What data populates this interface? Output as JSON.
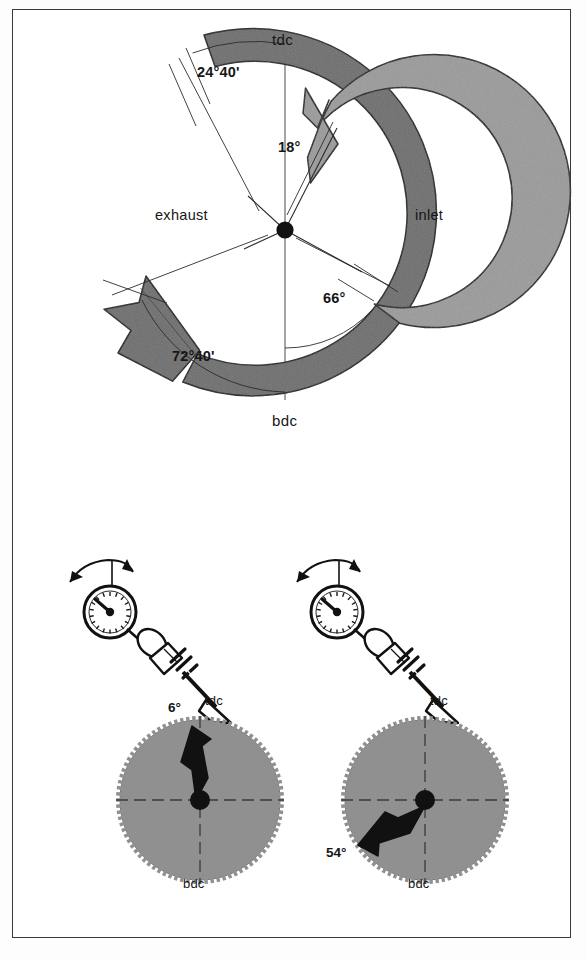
{
  "page": {
    "background_color": "#ffffff",
    "frame_color": "#3a3a3a"
  },
  "colors": {
    "inlet_ring": "#6e6e6e",
    "exhaust_ring": "#9a9a9a",
    "gear_fill": "#8c8c8c",
    "ink": "#161616",
    "outline": "#1a1a1a"
  },
  "timing_diagram": {
    "markers": {
      "top_dead_center": "tdc",
      "bottom_dead_center": "bdc"
    },
    "rings": [
      {
        "name": "inlet",
        "label": "inlet",
        "shade": "dark",
        "open_label": "24°40'",
        "close_label": "72°40'",
        "open_before_tdc_deg": 24.67,
        "close_after_bdc_deg": 72.67
      },
      {
        "name": "exhaust",
        "label": "exhaust",
        "shade": "light",
        "open_label": "66°",
        "close_label": "18°",
        "open_before_bdc_deg": 66,
        "close_after_tdc_deg": 18
      }
    ],
    "angle_labels": [
      {
        "id": "inlet-open",
        "text": "24°40'",
        "x": 197,
        "y": 72
      },
      {
        "id": "exhaust-close",
        "text": "18°",
        "x": 278,
        "y": 147
      },
      {
        "id": "exhaust-open",
        "text": "66°",
        "x": 323,
        "y": 298
      },
      {
        "id": "inlet-close",
        "text": "72°40'",
        "x": 172,
        "y": 356
      }
    ],
    "port_labels": [
      {
        "id": "exhaust",
        "text": "exhaust",
        "x": 155,
        "y": 207
      },
      {
        "id": "inlet",
        "text": "inlet",
        "x": 415,
        "y": 207
      }
    ],
    "dc_labels": [
      {
        "id": "tdc",
        "text": "tdc",
        "x": 272,
        "y": 31
      },
      {
        "id": "bdc",
        "text": "bdc",
        "x": 272,
        "y": 412
      }
    ]
  },
  "measurement_setups": [
    {
      "id": "left",
      "name": "inlet-valve-measurement",
      "instrument": "dial-gauge",
      "flywheel": {
        "top_label": "tdc",
        "bottom_label": "bdc",
        "angle_label": "6°",
        "angle_value": 6,
        "reference": "tdc",
        "arrow_direction": "up-left"
      },
      "labels": [
        {
          "id": "angle",
          "text": "6°",
          "x": 178,
          "y": 709
        },
        {
          "id": "tdc",
          "text": "tdc",
          "x": 211,
          "y": 700
        },
        {
          "id": "bdc",
          "text": "bdc",
          "x": 179,
          "y": 873
        }
      ]
    },
    {
      "id": "right",
      "name": "exhaust-valve-measurement",
      "instrument": "dial-gauge",
      "flywheel": {
        "top_label": "tdc",
        "bottom_label": "bdc",
        "angle_label": "54°",
        "angle_value": 54,
        "reference": "bdc",
        "arrow_direction": "down-left"
      },
      "labels": [
        {
          "id": "angle",
          "text": "54°",
          "x": 330,
          "y": 851
        },
        {
          "id": "tdc",
          "text": "tdc",
          "x": 438,
          "y": 700
        },
        {
          "id": "bdc",
          "text": "bdc",
          "x": 404,
          "y": 873
        }
      ]
    }
  ]
}
